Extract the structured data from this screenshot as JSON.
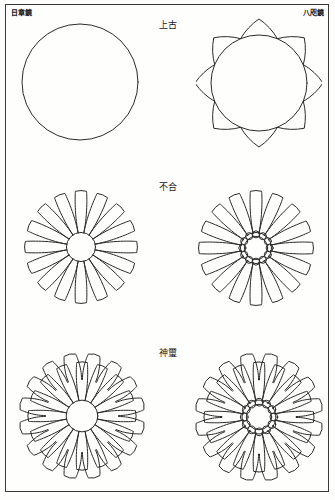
{
  "page": {
    "background_color": "#fdfdfc",
    "frame_color": "#3a3a3a",
    "ink_color": "#2b2b2b"
  },
  "corner_labels": {
    "top_left": "日章鏡",
    "top_right": "八咫鏡"
  },
  "rows": [
    {
      "label": "上古",
      "figures": [
        {
          "name": "plain-circle",
          "type": "circle",
          "petals": 0,
          "center": "none",
          "layers": 1
        },
        {
          "name": "eight-point-star",
          "type": "star",
          "points": 8,
          "cusp": "concave",
          "center": "none",
          "layers": 1
        }
      ]
    },
    {
      "label": "不合",
      "figures": [
        {
          "name": "chrysanthemum-solid-center",
          "type": "chrysanthemum",
          "petals": 16,
          "center": "disc",
          "layers": 1
        },
        {
          "name": "chrysanthemum-ring-center",
          "type": "chrysanthemum",
          "petals": 16,
          "center": "scalloped-ring",
          "center_scallops": 12,
          "layers": 1
        }
      ]
    },
    {
      "label": "神璽",
      "figures": [
        {
          "name": "double-chrysanthemum-solid-center",
          "type": "chrysanthemum",
          "petals": 16,
          "back_petals": 16,
          "center": "disc",
          "layers": 2
        },
        {
          "name": "double-chrysanthemum-ring-center",
          "type": "chrysanthemum",
          "petals": 16,
          "back_petals": 16,
          "center": "scalloped-ring",
          "center_scallops": 12,
          "layers": 2
        }
      ]
    }
  ]
}
